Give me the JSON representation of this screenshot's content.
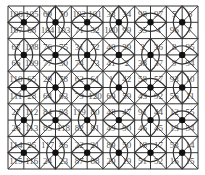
{
  "puzzle": {
    "rows": 10,
    "cols": 12,
    "grid": [
      [
        106,
        105,
        69,
        70,
        102,
        101,
        33,
        34,
        98,
        97,
        5,
        6
      ],
      [
        107,
        68,
        104,
        103,
        71,
        32,
        100,
        99,
        35,
        4,
        96,
        7
      ],
      [
        67,
        108,
        76,
        75,
        31,
        72,
        40,
        39,
        3,
        36,
        8,
        95
      ],
      [
        66,
        109,
        77,
        30,
        74,
        73,
        41,
        2,
        38,
        37,
        9,
        94
      ],
      [
        110,
        65,
        29,
        78,
        62,
        61,
        1,
        42,
        58,
        57,
        93,
        10
      ],
      [
        111,
        28,
        64,
        63,
        79,
        120,
        60,
        59,
        43,
        92,
        56,
        11
      ],
      [
        27,
        112,
        84,
        83,
        119,
        80,
        48,
        47,
        91,
        44,
        12,
        55
      ],
      [
        26,
        113,
        85,
        118,
        82,
        81,
        49,
        90,
        46,
        45,
        13,
        54
      ],
      [
        114,
        25,
        117,
        86,
        22,
        21,
        89,
        50,
        18,
        17,
        53,
        14
      ],
      [
        115,
        116,
        24,
        23,
        87,
        88,
        20,
        19,
        51,
        52,
        16,
        15
      ]
    ],
    "dot_rows": 5,
    "dot_cols": 6,
    "colors": {
      "grid_line": "#333333",
      "curve": "#333333",
      "dot": "#111111",
      "number": "#555555"
    }
  }
}
